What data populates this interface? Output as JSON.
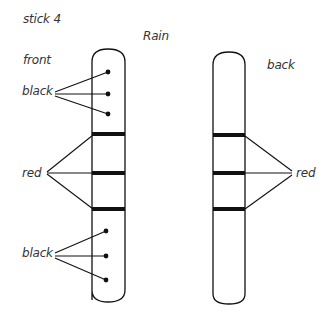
{
  "title": "stick 4",
  "subtitle": "Rain",
  "front_stick": {
    "label": "front",
    "top_label": "black",
    "middle_label": "red",
    "bottom_label": "black",
    "top_dots": 3,
    "bands": 3,
    "bottom_dots": 3
  },
  "back_stick": {
    "label": "back",
    "bands_label": "red",
    "bands": 3
  },
  "colors": {
    "line": "#111111",
    "band": "#111111",
    "text": "#333333",
    "background": "#ffffff"
  }
}
